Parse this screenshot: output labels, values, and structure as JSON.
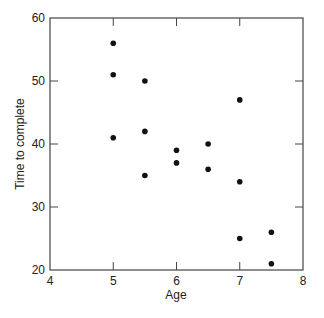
{
  "chart_data": {
    "type": "scatter",
    "title": "",
    "xlabel": "Age",
    "ylabel": "Time to complete",
    "xlim": [
      4,
      8
    ],
    "ylim": [
      20,
      60
    ],
    "xticks": [
      4,
      5,
      6,
      7,
      8
    ],
    "yticks": [
      20,
      30,
      40,
      50,
      60
    ],
    "grid": false,
    "legend": null,
    "marker_color": "#111111",
    "series": [
      {
        "name": "observations",
        "points": [
          {
            "x": 5,
            "y": 56
          },
          {
            "x": 5,
            "y": 51
          },
          {
            "x": 5,
            "y": 41
          },
          {
            "x": 5.5,
            "y": 50
          },
          {
            "x": 5.5,
            "y": 42
          },
          {
            "x": 5.5,
            "y": 35
          },
          {
            "x": 6,
            "y": 39
          },
          {
            "x": 6,
            "y": 37
          },
          {
            "x": 6.5,
            "y": 40
          },
          {
            "x": 6.5,
            "y": 36
          },
          {
            "x": 7,
            "y": 47
          },
          {
            "x": 7,
            "y": 34
          },
          {
            "x": 7,
            "y": 25
          },
          {
            "x": 7.5,
            "y": 26
          },
          {
            "x": 7.5,
            "y": 21
          }
        ]
      }
    ]
  }
}
